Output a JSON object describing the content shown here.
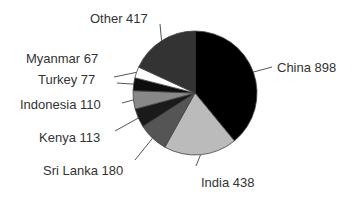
{
  "chart_data": {
    "type": "pie",
    "title": "",
    "start_angle_deg": 0,
    "direction": "clockwise",
    "total": 2300,
    "categories": [
      "China",
      "India",
      "Sri Lanka",
      "Kenya",
      "Indonesia",
      "Turkey",
      "Myanmar",
      "Other"
    ],
    "values": [
      898,
      438,
      180,
      113,
      110,
      77,
      67,
      417
    ],
    "labels": [
      "China 898",
      "India 438",
      "Sri Lanka 180",
      "Kenya 113",
      "Indonesia 110",
      "Turkey 77",
      "Myanmar 67",
      "Other 417"
    ],
    "colors": [
      "#000000",
      "#bbbbbb",
      "#555555",
      "#1a1a1a",
      "#888888",
      "#0d0d0d",
      "#ffffff",
      "#333333"
    ],
    "legend": "none",
    "label_style": "leader-lines"
  }
}
